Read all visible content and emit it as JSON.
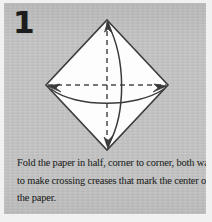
{
  "panel": {
    "background_color": "#c3c4c3",
    "page_background_color": "#f1f1f1"
  },
  "step": {
    "number": "1"
  },
  "diagram": {
    "name": "origami-square-crease-diagram",
    "paper_fill_color": "#fdfdfd",
    "outline_color": "#3a3a3a",
    "crease_color": "#4a4a4a",
    "arrow_color": "#3a3a3a",
    "shape": "diamond",
    "creases": [
      {
        "name": "vertical-crease",
        "style": "dashed"
      },
      {
        "name": "horizontal-crease",
        "style": "dashed"
      }
    ],
    "arrows": [
      {
        "name": "vertical-fold-arrow",
        "style": "curved-double-headed"
      },
      {
        "name": "horizontal-fold-arrow",
        "style": "curved-double-headed"
      }
    ]
  },
  "caption": {
    "lines": [
      "Fold the paper in half, corner to corner, both ways,",
      "to make crossing creases that mark the center of",
      "the paper."
    ],
    "full_text": "Fold the paper in half, corner to corner, both ways, to make crossing creases that mark the center of the paper."
  }
}
